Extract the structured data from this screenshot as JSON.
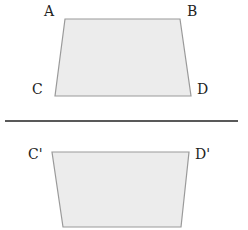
{
  "diagram": {
    "type": "reflection-trapezoid",
    "colors": {
      "shape_fill": "#ececec",
      "shape_stroke": "#9a9a9a",
      "mirror_line": "#222222",
      "label": "#222222"
    },
    "original": {
      "labels": {
        "top_left": "A",
        "top_right": "B",
        "bottom_left": "C",
        "bottom_right": "D"
      },
      "vertices": {
        "A": [
          65,
          19
        ],
        "B": [
          180,
          19
        ],
        "D": [
          191,
          96
        ],
        "C": [
          55,
          96
        ]
      }
    },
    "mirror_line": {
      "x1": 5,
      "y1": 121,
      "x2": 238,
      "y2": 121
    },
    "reflected": {
      "labels": {
        "top_left": "C'",
        "top_right": "D'"
      },
      "vertices": {
        "C'": [
          52,
          152
        ],
        "D'": [
          189,
          152
        ],
        "B'": [
          181,
          227
        ],
        "A'": [
          63,
          227
        ]
      }
    }
  }
}
